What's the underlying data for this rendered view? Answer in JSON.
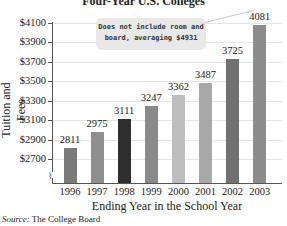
{
  "chart_data": {
    "type": "bar",
    "title": "Four-Year U.S. Colleges",
    "xlabel": "Ending Year in the School Year",
    "ylabel": "Tuition and Fees",
    "categories": [
      "1996",
      "1997",
      "1998",
      "1999",
      "2000",
      "2001",
      "2002",
      "2003"
    ],
    "values": [
      2811,
      2975,
      3111,
      3247,
      3362,
      3487,
      3725,
      4081
    ],
    "ylim": [
      2700,
      4100
    ],
    "yticks": [
      "$4100",
      "$3900",
      "$3700",
      "$3500",
      "$3300",
      "$3100",
      "$2900",
      "$2700"
    ],
    "axis_break": true,
    "grid": true,
    "annotation": "Does not include room and board, averaging $4931",
    "source": "The College Board",
    "bar_colors": [
      "#7a7a7a",
      "#8e8e8e",
      "#2e2e2e",
      "#8a8a8a",
      "#bdbdbd",
      "#a8a8a8",
      "#707070",
      "#8c8c8c"
    ]
  },
  "labels": {
    "title": "Four-Year U.S. Colleges",
    "ylabel": "Tuition and Fees",
    "xlabel": "Ending Year in the School Year",
    "source_prefix": "Source:",
    "source_text": " The College Board",
    "callout_line1": "Does not include room and",
    "callout_line2": "board, averaging $4931"
  }
}
